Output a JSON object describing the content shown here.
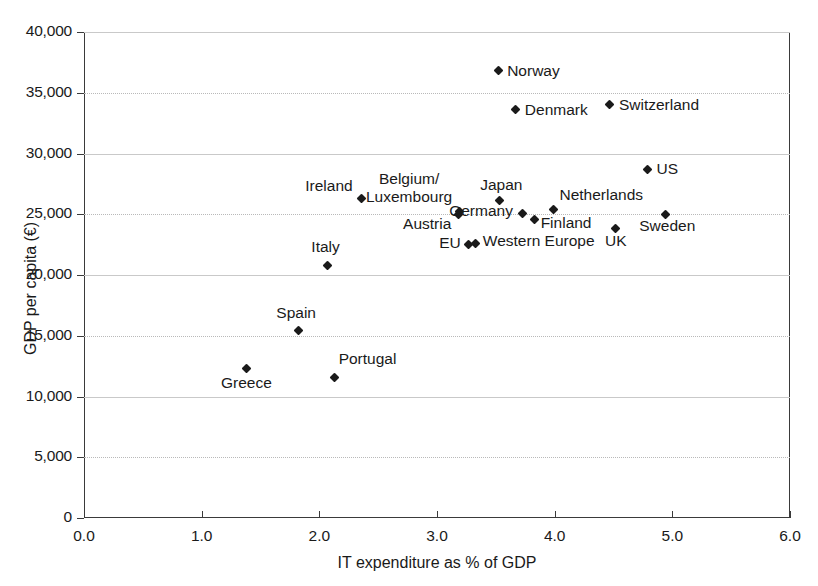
{
  "chart_data": {
    "type": "scatter",
    "title": "",
    "xlabel": "IT expenditure as % of GDP",
    "ylabel": "GDP per capita (€)",
    "xlim": [
      0.0,
      6.0
    ],
    "ylim": [
      0,
      40000
    ],
    "xticks": [
      "0.0",
      "1.0",
      "2.0",
      "3.0",
      "4.0",
      "5.0",
      "6.0"
    ],
    "xtick_values": [
      0.0,
      1.0,
      2.0,
      3.0,
      4.0,
      5.0,
      6.0
    ],
    "yticks": [
      "0",
      "5,000",
      "10,000",
      "15,000",
      "20,000",
      "25,000",
      "30,000",
      "35,000",
      "40,000"
    ],
    "ytick_values": [
      0,
      5000,
      10000,
      15000,
      20000,
      25000,
      30000,
      35000,
      40000
    ],
    "grid": true,
    "legend": "none",
    "marker": "diamond",
    "marker_color": "#1a1a1a",
    "points": [
      {
        "label": "Norway",
        "x": 3.52,
        "y": 36800,
        "lx": 9,
        "ly": -8,
        "align": "left"
      },
      {
        "label": "Switzerland",
        "x": 4.47,
        "y": 34000,
        "lx": 9,
        "ly": -8,
        "align": "left"
      },
      {
        "label": "Denmark",
        "x": 3.67,
        "y": 33600,
        "lx": 9,
        "ly": -8,
        "align": "left"
      },
      {
        "label": "US",
        "x": 4.79,
        "y": 28700,
        "lx": 9,
        "ly": -8,
        "align": "left"
      },
      {
        "label": "Ireland",
        "x": 2.36,
        "y": 26300,
        "lx": -9,
        "ly": -20,
        "align": "right"
      },
      {
        "label": "Japan",
        "x": 3.53,
        "y": 26100,
        "lx": 2,
        "ly": -24,
        "align": "center"
      },
      {
        "label": "Netherlands",
        "x": 3.99,
        "y": 25400,
        "lx": 6,
        "ly": -22,
        "align": "left"
      },
      {
        "label": "Belgium/\nLuxembourg",
        "x": 3.18,
        "y": 25000,
        "lx": -6,
        "ly": -44,
        "align": "right"
      },
      {
        "label": "Austria",
        "x": 3.19,
        "y": 25200,
        "lx": -8,
        "ly": 4,
        "align": "right"
      },
      {
        "label": "Germany",
        "x": 3.73,
        "y": 25100,
        "lx": -10,
        "ly": -10,
        "align": "right"
      },
      {
        "label": "Sweden",
        "x": 4.94,
        "y": 25000,
        "lx": 2,
        "ly": 4,
        "align": "center"
      },
      {
        "label": "Finland",
        "x": 3.83,
        "y": 24600,
        "lx": 6,
        "ly": -4,
        "align": "left"
      },
      {
        "label": "UK",
        "x": 4.52,
        "y": 23800,
        "lx": 0,
        "ly": 4,
        "align": "center"
      },
      {
        "label": "Western Europe",
        "x": 3.33,
        "y": 22600,
        "lx": 7,
        "ly": -10,
        "align": "left"
      },
      {
        "label": "EU",
        "x": 3.27,
        "y": 22500,
        "lx": -8,
        "ly": -10,
        "align": "right"
      },
      {
        "label": "Italy",
        "x": 2.07,
        "y": 20800,
        "lx": -2,
        "ly": -26,
        "align": "center"
      },
      {
        "label": "Spain",
        "x": 1.82,
        "y": 15400,
        "lx": -2,
        "ly": -26,
        "align": "center"
      },
      {
        "label": "Greece",
        "x": 1.38,
        "y": 12300,
        "lx": 0,
        "ly": 6,
        "align": "center"
      },
      {
        "label": "Portugal",
        "x": 2.13,
        "y": 11600,
        "lx": 4,
        "ly": -26,
        "align": "left"
      }
    ]
  }
}
